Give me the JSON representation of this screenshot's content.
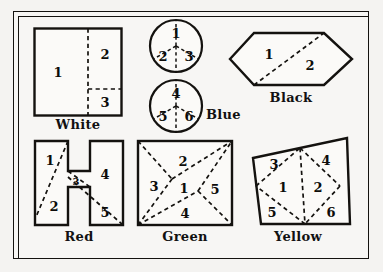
{
  "figure": {
    "border_color": "#14120f",
    "paper_color": "#f4f3f1",
    "dash_style": "dashed-cut-lines"
  },
  "shapes": [
    {
      "id": "white",
      "caption": "White",
      "outline": "square",
      "piece_count": 3,
      "pieces": [
        "1",
        "2",
        "3"
      ]
    },
    {
      "id": "blue",
      "caption": "Blue",
      "outline": "two-circles",
      "piece_count": 6,
      "pieces_top": [
        "1",
        "2",
        "3"
      ],
      "pieces_bottom": [
        "4",
        "5",
        "6"
      ]
    },
    {
      "id": "black",
      "caption": "Black",
      "outline": "hexagon",
      "piece_count": 2,
      "pieces": [
        "1",
        "2"
      ]
    },
    {
      "id": "red",
      "caption": "Red",
      "outline": "h-shape",
      "piece_count": 5,
      "pieces": [
        "1",
        "2",
        "3",
        "4",
        "5"
      ]
    },
    {
      "id": "green",
      "caption": "Green",
      "outline": "square",
      "piece_count": 5,
      "pieces": [
        "1",
        "2",
        "3",
        "4",
        "5"
      ]
    },
    {
      "id": "yellow",
      "caption": "Yellow",
      "outline": "quadrilateral",
      "piece_count": 6,
      "pieces": [
        "1",
        "2",
        "3",
        "4",
        "5",
        "6"
      ]
    }
  ],
  "labels": {
    "white_1": "1",
    "white_2": "2",
    "white_3": "3",
    "blue_1": "1",
    "blue_2": "2",
    "blue_3": "3",
    "blue_4": "4",
    "blue_5": "5",
    "blue_6": "6",
    "black_1": "1",
    "black_2": "2",
    "red_1": "1",
    "red_2": "2",
    "red_3": "3",
    "red_4": "4",
    "red_5": "5",
    "green_1": "1",
    "green_2": "2",
    "green_3": "3",
    "green_4": "4",
    "green_5": "5",
    "yellow_1": "1",
    "yellow_2": "2",
    "yellow_3": "3",
    "yellow_4": "4",
    "yellow_5": "5",
    "yellow_6": "6"
  },
  "captions": {
    "white": "White",
    "blue": "Blue",
    "black": "Black",
    "red": "Red",
    "green": "Green",
    "yellow": "Yellow"
  }
}
